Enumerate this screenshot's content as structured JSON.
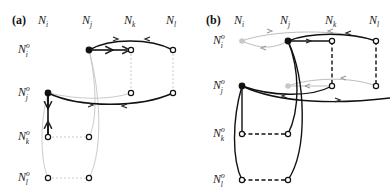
{
  "figure": {
    "panels": [
      {
        "id": "a",
        "label": "(a)",
        "columns": [
          {
            "base": "N",
            "sub": "i",
            "x": 45
          },
          {
            "base": "N",
            "sub": "j",
            "x": 89
          },
          {
            "base": "N",
            "sub": "k",
            "x": 131
          },
          {
            "base": "N",
            "sub": "l",
            "x": 173
          }
        ],
        "rows": [
          {
            "base": "N",
            "sub": "i",
            "sup": "o",
            "y": 50
          },
          {
            "base": "N",
            "sub": "j",
            "sup": "o",
            "y": 93
          },
          {
            "base": "N",
            "sub": "k",
            "sup": "o",
            "y": 137
          },
          {
            "base": "N",
            "sub": "l",
            "sup": "o",
            "y": 178
          }
        ]
      },
      {
        "id": "b",
        "label": "(b)",
        "columns": [
          {
            "base": "N",
            "sub": "i",
            "x": 242
          },
          {
            "base": "N",
            "sub": "j",
            "x": 288
          },
          {
            "base": "N",
            "sub": "k",
            "x": 332
          },
          {
            "base": "N",
            "sub": "l",
            "x": 376
          }
        ],
        "rows": [
          {
            "base": "N",
            "sub": "i",
            "sup": "o",
            "y": 41
          },
          {
            "base": "N",
            "sub": "j",
            "sup": "o",
            "y": 86
          },
          {
            "base": "N",
            "sub": "k",
            "sup": "o",
            "y": 134
          },
          {
            "base": "N",
            "sub": "l",
            "sup": "o",
            "y": 180
          }
        ]
      }
    ],
    "colors": {
      "dark": "#111111",
      "light": "#bbbbbb",
      "filled_node": "#111111",
      "ghost_node": "#c8c8c8"
    }
  }
}
